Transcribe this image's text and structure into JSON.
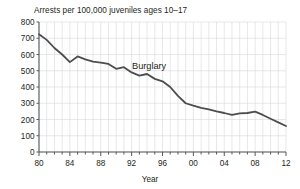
{
  "chart_data": {
    "type": "line",
    "title": "Arrests per 100,000 juveniles ages 10–17",
    "subtitle": "",
    "xlabel": "Year",
    "ylabel": "",
    "grid": true,
    "legend_position": "inline-annotation",
    "xlim": [
      1980,
      2012
    ],
    "ylim": [
      0,
      800
    ],
    "y_ticks": [
      0,
      100,
      200,
      300,
      400,
      500,
      600,
      700,
      800
    ],
    "y_tick_labels": [
      "0",
      "100",
      "200",
      "300",
      "400",
      "500",
      "600",
      "700",
      "800"
    ],
    "x_ticks": [
      1980,
      1984,
      1988,
      1992,
      1996,
      2000,
      2004,
      2008,
      2012
    ],
    "x_tick_labels": [
      "80",
      "84",
      "88",
      "92",
      "96",
      "00",
      "04",
      "08",
      "12"
    ],
    "x_minor_tick_interval": 1,
    "series": [
      {
        "name": "Burglary",
        "color": "#4d4d4f",
        "annotation": "Burglary",
        "x": [
          1980,
          1981,
          1982,
          1983,
          1984,
          1985,
          1986,
          1987,
          1988,
          1989,
          1990,
          1991,
          1992,
          1993,
          1994,
          1995,
          1996,
          1997,
          1998,
          1999,
          2000,
          2001,
          2002,
          2003,
          2004,
          2005,
          2006,
          2007,
          2008,
          2009,
          2010,
          2011,
          2012
        ],
        "values": [
          725,
          690,
          640,
          600,
          553,
          588,
          570,
          556,
          550,
          542,
          512,
          522,
          490,
          470,
          480,
          450,
          435,
          400,
          345,
          300,
          285,
          272,
          262,
          250,
          240,
          228,
          238,
          240,
          248,
          228,
          205,
          182,
          160
        ]
      }
    ]
  },
  "axis": {
    "x_axis_title": "Year"
  }
}
